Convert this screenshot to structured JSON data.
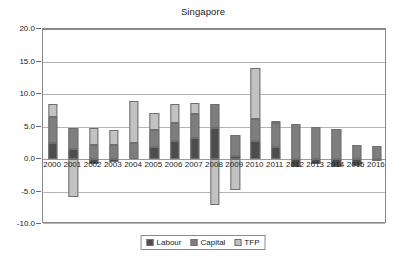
{
  "chart_data": {
    "type": "bar",
    "title": "Singapore",
    "xlabel": "",
    "ylabel": "",
    "ylim": [
      -10.0,
      20.0
    ],
    "yticks": [
      "20.0",
      "15.0",
      "10.0",
      "5.0",
      "0.0",
      "-5.0",
      "-10.0"
    ],
    "ytick_values": [
      20.0,
      15.0,
      10.0,
      5.0,
      0.0,
      -5.0,
      -10.0
    ],
    "grid": true,
    "stacked": true,
    "legend_position": "bottom",
    "categories": [
      "2000",
      "2001",
      "2002",
      "2003",
      "2004",
      "2005",
      "2006",
      "2007",
      "2008",
      "2009",
      "2010",
      "2011",
      "2012",
      "2013",
      "2014",
      "2015",
      "2016"
    ],
    "series": [
      {
        "name": "Labour",
        "color": "#4d4d4d",
        "values": [
          2.5,
          1.6,
          -0.7,
          -0.5,
          0.0,
          1.9,
          2.7,
          3.2,
          4.7,
          0.5,
          2.7,
          1.8,
          -1.3,
          -0.8,
          -1.3,
          -1.1,
          -0.3
        ]
      },
      {
        "name": "Capital",
        "color": "#7e7e7e",
        "values": [
          3.9,
          3.1,
          2.2,
          2.1,
          2.5,
          2.6,
          2.8,
          3.7,
          3.8,
          3.2,
          3.5,
          3.8,
          5.4,
          5.0,
          4.6,
          2.1,
          2.0
        ]
      },
      {
        "name": "TFP",
        "color": "#c2c2c2",
        "values": [
          2.1,
          -5.8,
          2.5,
          2.4,
          6.5,
          2.6,
          2.9,
          1.7,
          -7.1,
          -4.8,
          7.8,
          0.2,
          0.0,
          0.0,
          0.0,
          0.0,
          0.0
        ]
      }
    ],
    "legend": [
      "Labour",
      "Capital",
      "TFP"
    ]
  },
  "legend": {
    "items": [
      {
        "label": "Labour",
        "color": "#4d4d4d"
      },
      {
        "label": "Capital",
        "color": "#7e7e7e"
      },
      {
        "label": "TFP",
        "color": "#c2c2c2"
      }
    ]
  }
}
